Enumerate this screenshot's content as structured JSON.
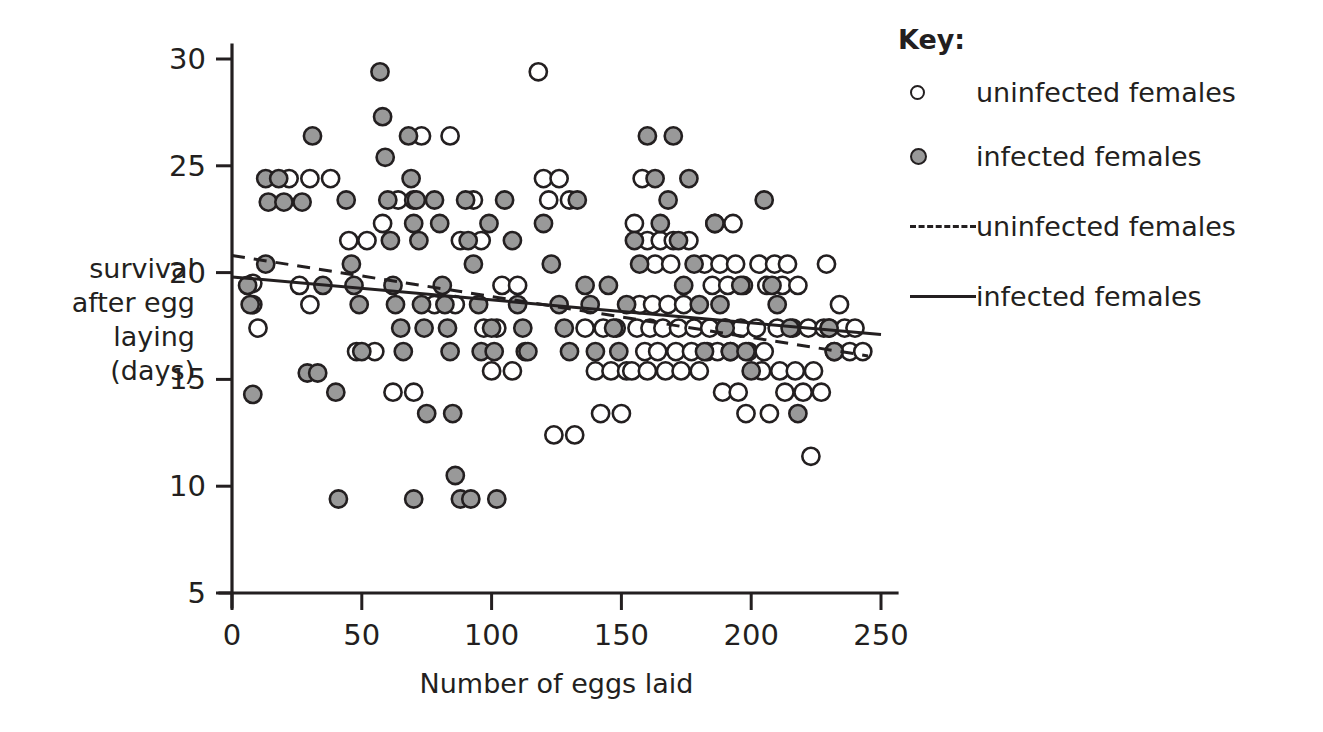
{
  "chart_data": {
    "type": "scatter",
    "title": "",
    "xlabel": "Number of eggs laid",
    "ylabel": "survival after egg laying (days)",
    "ylabel_lines": [
      "survival",
      "after egg",
      "laying",
      "(days)"
    ],
    "xlim": [
      0,
      250
    ],
    "ylim": [
      5,
      30
    ],
    "xticks": [
      0,
      50,
      100,
      150,
      200,
      250
    ],
    "yticks": [
      5,
      10,
      15,
      20,
      25,
      30
    ],
    "grid": false,
    "legend_position": "right",
    "series": [
      {
        "name": "uninfected females",
        "marker": "open-circle",
        "marker_fill": "#ffffff",
        "marker_stroke": "#231f20",
        "points": [
          [
            8,
            19.5
          ],
          [
            8,
            18.5
          ],
          [
            10,
            17.4
          ],
          [
            22,
            24.4
          ],
          [
            30,
            24.4
          ],
          [
            38,
            24.4
          ],
          [
            26,
            19.4
          ],
          [
            30,
            18.5
          ],
          [
            45,
            21.5
          ],
          [
            52,
            21.5
          ],
          [
            58,
            22.3
          ],
          [
            48,
            16.3
          ],
          [
            55,
            16.3
          ],
          [
            62,
            14.4
          ],
          [
            70,
            14.4
          ],
          [
            64,
            23.4
          ],
          [
            70,
            23.4
          ],
          [
            73,
            26.4
          ],
          [
            78,
            18.5
          ],
          [
            86,
            18.5
          ],
          [
            88,
            21.5
          ],
          [
            96,
            21.5
          ],
          [
            84,
            26.4
          ],
          [
            93,
            23.4
          ],
          [
            97,
            17.4
          ],
          [
            102,
            17.4
          ],
          [
            104,
            19.4
          ],
          [
            110,
            19.4
          ],
          [
            100,
            15.4
          ],
          [
            108,
            15.4
          ],
          [
            113,
            16.3
          ],
          [
            118,
            29.4
          ],
          [
            120,
            24.4
          ],
          [
            126,
            24.4
          ],
          [
            122,
            23.4
          ],
          [
            130,
            23.4
          ],
          [
            124,
            12.4
          ],
          [
            132,
            12.4
          ],
          [
            136,
            17.4
          ],
          [
            143,
            17.4
          ],
          [
            148,
            17.4
          ],
          [
            140,
            15.4
          ],
          [
            146,
            15.4
          ],
          [
            152,
            15.4
          ],
          [
            142,
            13.4
          ],
          [
            150,
            13.4
          ],
          [
            155,
            22.3
          ],
          [
            160,
            21.5
          ],
          [
            165,
            21.5
          ],
          [
            170,
            21.5
          ],
          [
            176,
            21.5
          ],
          [
            158,
            24.4
          ],
          [
            163,
            20.4
          ],
          [
            169,
            20.4
          ],
          [
            157,
            18.5
          ],
          [
            162,
            18.5
          ],
          [
            168,
            18.5
          ],
          [
            174,
            18.5
          ],
          [
            156,
            17.4
          ],
          [
            161,
            17.4
          ],
          [
            166,
            17.4
          ],
          [
            172,
            17.4
          ],
          [
            178,
            17.4
          ],
          [
            159,
            16.3
          ],
          [
            164,
            16.3
          ],
          [
            171,
            16.3
          ],
          [
            177,
            16.3
          ],
          [
            183,
            16.3
          ],
          [
            154,
            15.4
          ],
          [
            160,
            15.4
          ],
          [
            167,
            15.4
          ],
          [
            173,
            15.4
          ],
          [
            180,
            15.4
          ],
          [
            182,
            20.4
          ],
          [
            188,
            20.4
          ],
          [
            194,
            20.4
          ],
          [
            185,
            19.4
          ],
          [
            191,
            19.4
          ],
          [
            197,
            19.4
          ],
          [
            186,
            22.3
          ],
          [
            193,
            22.3
          ],
          [
            184,
            17.4
          ],
          [
            190,
            17.4
          ],
          [
            196,
            17.4
          ],
          [
            202,
            17.4
          ],
          [
            187,
            16.3
          ],
          [
            192,
            16.3
          ],
          [
            199,
            16.3
          ],
          [
            205,
            16.3
          ],
          [
            189,
            14.4
          ],
          [
            195,
            14.4
          ],
          [
            198,
            13.4
          ],
          [
            207,
            13.4
          ],
          [
            203,
            20.4
          ],
          [
            209,
            20.4
          ],
          [
            214,
            20.4
          ],
          [
            206,
            19.4
          ],
          [
            212,
            19.4
          ],
          [
            218,
            19.4
          ],
          [
            210,
            17.4
          ],
          [
            216,
            17.4
          ],
          [
            222,
            17.4
          ],
          [
            228,
            17.4
          ],
          [
            204,
            15.4
          ],
          [
            211,
            15.4
          ],
          [
            217,
            15.4
          ],
          [
            224,
            15.4
          ],
          [
            213,
            14.4
          ],
          [
            220,
            14.4
          ],
          [
            227,
            14.4
          ],
          [
            223,
            11.4
          ],
          [
            230,
            17.4
          ],
          [
            236,
            17.4
          ],
          [
            240,
            17.4
          ],
          [
            232,
            16.3
          ],
          [
            238,
            16.3
          ],
          [
            243,
            16.3
          ],
          [
            234,
            18.5
          ],
          [
            229,
            20.4
          ]
        ]
      },
      {
        "name": "infected females",
        "marker": "filled-circle",
        "marker_fill": "#999999",
        "marker_stroke": "#231f20",
        "points": [
          [
            6,
            19.4
          ],
          [
            7,
            18.5
          ],
          [
            8,
            14.3
          ],
          [
            13,
            24.4
          ],
          [
            18,
            24.4
          ],
          [
            14,
            23.3
          ],
          [
            20,
            23.3
          ],
          [
            13,
            20.4
          ],
          [
            27,
            23.3
          ],
          [
            31,
            26.4
          ],
          [
            29,
            15.3
          ],
          [
            33,
            15.3
          ],
          [
            35,
            19.4
          ],
          [
            40,
            14.4
          ],
          [
            41,
            9.4
          ],
          [
            44,
            23.4
          ],
          [
            46,
            20.4
          ],
          [
            47,
            19.4
          ],
          [
            49,
            18.5
          ],
          [
            50,
            16.3
          ],
          [
            57,
            29.4
          ],
          [
            58,
            27.3
          ],
          [
            59,
            25.4
          ],
          [
            60,
            23.4
          ],
          [
            61,
            21.5
          ],
          [
            62,
            19.4
          ],
          [
            63,
            18.5
          ],
          [
            65,
            17.4
          ],
          [
            66,
            16.3
          ],
          [
            68,
            26.4
          ],
          [
            69,
            24.4
          ],
          [
            70,
            22.3
          ],
          [
            71,
            23.4
          ],
          [
            72,
            21.5
          ],
          [
            73,
            18.5
          ],
          [
            74,
            17.4
          ],
          [
            75,
            13.4
          ],
          [
            70,
            9.4
          ],
          [
            78,
            23.4
          ],
          [
            80,
            22.3
          ],
          [
            81,
            19.4
          ],
          [
            82,
            18.5
          ],
          [
            83,
            17.4
          ],
          [
            84,
            16.3
          ],
          [
            85,
            13.4
          ],
          [
            86,
            10.5
          ],
          [
            88,
            9.4
          ],
          [
            92,
            9.4
          ],
          [
            90,
            23.4
          ],
          [
            91,
            21.5
          ],
          [
            93,
            20.4
          ],
          [
            95,
            18.5
          ],
          [
            96,
            16.3
          ],
          [
            99,
            22.3
          ],
          [
            100,
            17.4
          ],
          [
            101,
            16.3
          ],
          [
            102,
            9.4
          ],
          [
            105,
            23.4
          ],
          [
            108,
            21.5
          ],
          [
            110,
            18.5
          ],
          [
            112,
            17.4
          ],
          [
            114,
            16.3
          ],
          [
            120,
            22.3
          ],
          [
            123,
            20.4
          ],
          [
            126,
            18.5
          ],
          [
            128,
            17.4
          ],
          [
            130,
            16.3
          ],
          [
            133,
            23.4
          ],
          [
            136,
            19.4
          ],
          [
            138,
            18.5
          ],
          [
            140,
            16.3
          ],
          [
            145,
            19.4
          ],
          [
            147,
            17.4
          ],
          [
            149,
            16.3
          ],
          [
            152,
            18.5
          ],
          [
            155,
            21.5
          ],
          [
            157,
            20.4
          ],
          [
            160,
            26.4
          ],
          [
            163,
            24.4
          ],
          [
            165,
            22.3
          ],
          [
            168,
            23.4
          ],
          [
            170,
            26.4
          ],
          [
            172,
            21.5
          ],
          [
            174,
            19.4
          ],
          [
            176,
            24.4
          ],
          [
            178,
            20.4
          ],
          [
            180,
            18.5
          ],
          [
            182,
            16.3
          ],
          [
            186,
            22.3
          ],
          [
            188,
            18.5
          ],
          [
            190,
            17.4
          ],
          [
            192,
            16.3
          ],
          [
            196,
            19.4
          ],
          [
            198,
            16.3
          ],
          [
            200,
            15.4
          ],
          [
            205,
            23.4
          ],
          [
            208,
            19.4
          ],
          [
            210,
            18.5
          ],
          [
            215,
            17.4
          ],
          [
            218,
            13.4
          ],
          [
            230,
            17.4
          ],
          [
            232,
            16.3
          ]
        ]
      }
    ],
    "trend_lines": [
      {
        "name": "uninfected females",
        "style": "dashed",
        "x_start": 0,
        "y_start": 20.8,
        "x_end": 245,
        "y_end": 16.1
      },
      {
        "name": "infected females",
        "style": "solid",
        "x_start": 0,
        "y_start": 19.8,
        "x_end": 250,
        "y_end": 17.1
      }
    ]
  },
  "axes": {
    "y_label_lines": [
      "survival",
      "after egg",
      "laying",
      "(days)"
    ],
    "x_label": "Number of eggs laid",
    "y_tick_labels": [
      "5",
      "10",
      "15",
      "20",
      "25",
      "30"
    ],
    "x_tick_labels": [
      "0",
      "50",
      "100",
      "150",
      "200",
      "250"
    ]
  },
  "legend": {
    "title": "Key:",
    "entries": [
      {
        "label": "uninfected females",
        "swatch": "open-circle-marker"
      },
      {
        "label": "infected females",
        "swatch": "filled-circle-marker"
      },
      {
        "label": "uninfected females",
        "swatch": "dashed-line"
      },
      {
        "label": "infected females",
        "swatch": "solid-line"
      }
    ]
  },
  "colors": {
    "ink": "#231f20",
    "marker_fill_infected": "#999999",
    "marker_fill_uninfected": "#ffffff",
    "background": "#ffffff"
  }
}
